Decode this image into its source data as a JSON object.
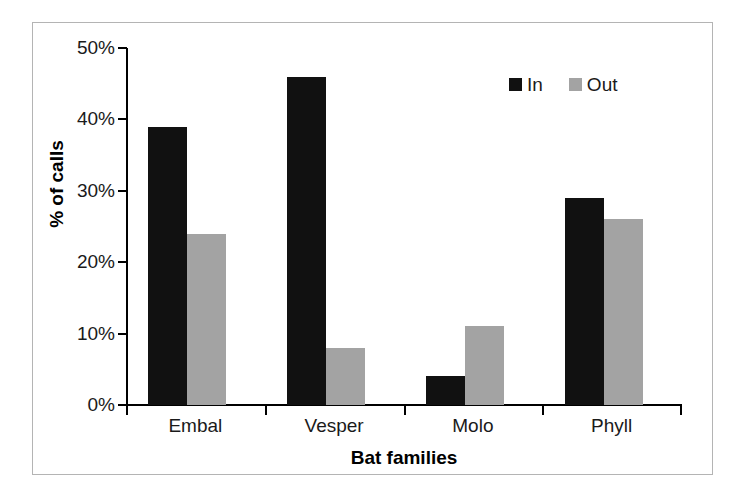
{
  "chart_data": {
    "type": "bar",
    "title": "",
    "xlabel": "Bat families",
    "ylabel": "% of calls",
    "categories": [
      "Embal",
      "Vesper",
      "Molo",
      "Phyll"
    ],
    "series": [
      {
        "name": "In",
        "color": "#111111",
        "values": [
          39,
          46,
          4,
          29
        ]
      },
      {
        "name": "Out",
        "color": "#a3a3a3",
        "values": [
          24,
          8,
          11,
          26
        ]
      }
    ],
    "ylim": [
      0,
      50
    ],
    "ytick_values": [
      0,
      10,
      20,
      30,
      40,
      50
    ],
    "ytick_labels": [
      "0%",
      "10%",
      "20%",
      "30%",
      "40%",
      "50%"
    ],
    "grid": false,
    "legend_position": "top-right",
    "units": "percent"
  },
  "legend": {
    "items": [
      {
        "label": "In",
        "swatch": "black-square-swatch"
      },
      {
        "label": "Out",
        "swatch": "gray-square-swatch"
      }
    ]
  },
  "axes": {
    "y_title": "% of calls",
    "x_title": "Bat families"
  }
}
